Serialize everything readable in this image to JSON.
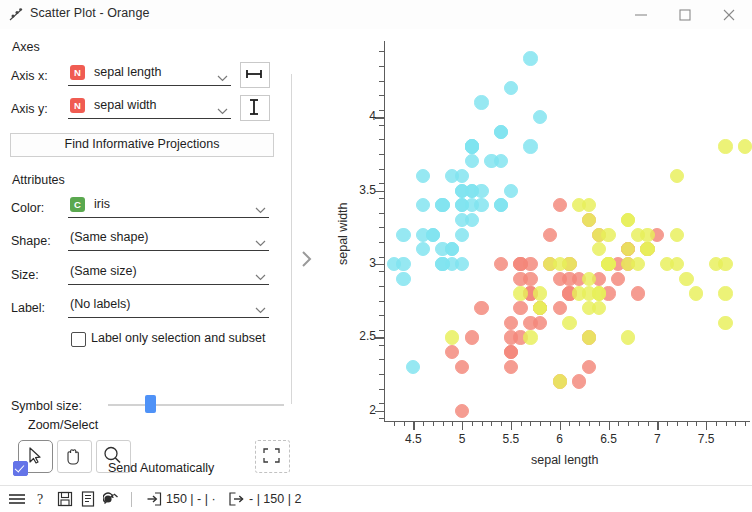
{
  "window": {
    "title": "Scatter Plot - Orange",
    "icon": "scatter-plot-icon",
    "minimize_label": "—",
    "maximize_label": "□",
    "close_label": "✕"
  },
  "panel": {
    "axes": {
      "group_label": "Axes",
      "x_label": "Axis x:",
      "x_value": "sepal length",
      "x_var_type": "N",
      "x_button_icon": "horizontal-resize-icon",
      "y_label": "Axis y:",
      "y_value": "sepal width",
      "y_var_type": "N",
      "y_button_icon": "vertical-resize-icon",
      "find_projections_label": "Find Informative Projections"
    },
    "attributes": {
      "group_label": "Attributes",
      "color_label": "Color:",
      "color_value": "iris",
      "color_var_type": "C",
      "shape_label": "Shape:",
      "shape_value": "(Same shape)",
      "size_label": "Size:",
      "size_value": "(Same size)",
      "label_label": "Label:",
      "label_value": "(No labels)",
      "label_only_checkbox": "Label only selection and subset",
      "label_only_checked": false,
      "symbol_size_label": "Symbol size:",
      "symbol_size_percent": 21
    },
    "zoom_select": {
      "group_label": "Zoom/Select",
      "tools": [
        {
          "name": "select-tool",
          "icon": "cursor-arrow-icon",
          "selected": true
        },
        {
          "name": "pan-tool",
          "icon": "hand-icon",
          "selected": false
        },
        {
          "name": "zoom-tool",
          "icon": "magnifier-icon",
          "selected": false
        }
      ],
      "reset_icon": "reset-zoom-icon"
    },
    "send": {
      "checkbox_checked": true,
      "label": "Send Automatically"
    },
    "expander_icon": "chevron-right-icon"
  },
  "statusbar": {
    "icons": [
      "hamburger-menu-icon",
      "help-icon",
      "save-icon",
      "report-icon",
      "clear-icon"
    ],
    "input_icon": "input-arrow-icon",
    "input_text": "150 | - | ·",
    "output_icon": "output-arrow-icon",
    "output_text": "- | 150 | 2"
  },
  "chart_data": {
    "type": "scatter",
    "title": "",
    "xlabel": "sepal length",
    "ylabel": "sepal width",
    "xlim": [
      4.2,
      7.95
    ],
    "ylim": [
      1.93,
      4.52
    ],
    "xticks": [
      4.5,
      5,
      5.5,
      6,
      6.5,
      7,
      7.5
    ],
    "xtick_labels": [
      "4.5",
      "5",
      "5.5",
      "6",
      "6.5",
      "7",
      "7.5"
    ],
    "yticks": [
      2,
      2.5,
      3,
      3.5,
      4
    ],
    "ytick_labels": [
      "2",
      "2.5",
      "3",
      "3.5",
      "4"
    ],
    "grid": false,
    "legend": "hidden",
    "color_by": "iris",
    "series": [
      {
        "name": "Iris-setosa",
        "color": "#7fe4f0",
        "points": [
          [
            5.1,
            3.5
          ],
          [
            4.9,
            3.0
          ],
          [
            4.7,
            3.2
          ],
          [
            4.6,
            3.1
          ],
          [
            5.0,
            3.6
          ],
          [
            5.4,
            3.9
          ],
          [
            4.6,
            3.4
          ],
          [
            5.0,
            3.4
          ],
          [
            4.4,
            2.9
          ],
          [
            4.9,
            3.1
          ],
          [
            5.4,
            3.7
          ],
          [
            4.8,
            3.4
          ],
          [
            4.8,
            3.0
          ],
          [
            4.3,
            3.0
          ],
          [
            5.8,
            4.0
          ],
          [
            5.7,
            4.4
          ],
          [
            5.4,
            3.9
          ],
          [
            5.1,
            3.5
          ],
          [
            5.7,
            3.8
          ],
          [
            5.1,
            3.8
          ],
          [
            5.4,
            3.4
          ],
          [
            5.1,
            3.7
          ],
          [
            4.6,
            3.6
          ],
          [
            5.1,
            3.3
          ],
          [
            4.8,
            3.4
          ],
          [
            5.0,
            3.0
          ],
          [
            5.0,
            3.4
          ],
          [
            5.2,
            3.5
          ],
          [
            5.2,
            3.4
          ],
          [
            4.7,
            3.2
          ],
          [
            4.8,
            3.1
          ],
          [
            5.4,
            3.4
          ],
          [
            5.2,
            4.1
          ],
          [
            5.5,
            4.2
          ],
          [
            4.9,
            3.1
          ],
          [
            5.0,
            3.2
          ],
          [
            5.5,
            3.5
          ],
          [
            4.9,
            3.6
          ],
          [
            4.4,
            3.0
          ],
          [
            5.1,
            3.4
          ],
          [
            5.0,
            3.5
          ],
          [
            4.5,
            2.3
          ],
          [
            4.4,
            3.2
          ],
          [
            5.0,
            3.5
          ],
          [
            5.1,
            3.8
          ],
          [
            4.8,
            3.0
          ],
          [
            5.1,
            3.8
          ],
          [
            4.6,
            3.2
          ],
          [
            5.3,
            3.7
          ],
          [
            5.0,
            3.3
          ]
        ]
      },
      {
        "name": "Iris-versicolor",
        "color": "#f4877a",
        "points": [
          [
            7.0,
            3.2
          ],
          [
            6.4,
            3.2
          ],
          [
            6.9,
            3.1
          ],
          [
            5.5,
            2.3
          ],
          [
            6.5,
            2.8
          ],
          [
            5.7,
            2.8
          ],
          [
            6.3,
            3.3
          ],
          [
            4.9,
            2.4
          ],
          [
            6.6,
            2.9
          ],
          [
            5.2,
            2.7
          ],
          [
            5.0,
            2.0
          ],
          [
            5.9,
            3.0
          ],
          [
            6.0,
            2.2
          ],
          [
            6.1,
            2.9
          ],
          [
            5.6,
            2.9
          ],
          [
            6.7,
            3.1
          ],
          [
            5.6,
            3.0
          ],
          [
            5.8,
            2.7
          ],
          [
            6.2,
            2.2
          ],
          [
            5.6,
            2.5
          ],
          [
            5.9,
            3.2
          ],
          [
            6.1,
            2.8
          ],
          [
            6.3,
            2.5
          ],
          [
            6.1,
            2.8
          ],
          [
            6.4,
            2.9
          ],
          [
            6.6,
            3.0
          ],
          [
            6.8,
            2.8
          ],
          [
            6.7,
            3.0
          ],
          [
            6.0,
            2.9
          ],
          [
            5.7,
            2.6
          ],
          [
            5.5,
            2.4
          ],
          [
            5.5,
            2.4
          ],
          [
            5.8,
            2.7
          ],
          [
            6.0,
            2.7
          ],
          [
            5.4,
            3.0
          ],
          [
            6.0,
            3.4
          ],
          [
            6.7,
            3.1
          ],
          [
            6.3,
            2.3
          ],
          [
            5.6,
            3.0
          ],
          [
            5.5,
            2.5
          ],
          [
            5.5,
            2.6
          ],
          [
            6.1,
            3.0
          ],
          [
            5.8,
            2.6
          ],
          [
            5.0,
            2.3
          ],
          [
            5.6,
            2.7
          ],
          [
            5.7,
            3.0
          ],
          [
            5.7,
            2.9
          ],
          [
            6.2,
            2.9
          ],
          [
            5.1,
            2.5
          ],
          [
            5.7,
            2.8
          ]
        ]
      },
      {
        "name": "Iris-virginica",
        "color": "#e8f05a",
        "points": [
          [
            6.3,
            3.3
          ],
          [
            5.8,
            2.7
          ],
          [
            7.1,
            3.0
          ],
          [
            6.3,
            2.9
          ],
          [
            6.5,
            3.0
          ],
          [
            7.6,
            3.0
          ],
          [
            4.9,
            2.5
          ],
          [
            7.3,
            2.9
          ],
          [
            6.7,
            2.5
          ],
          [
            7.2,
            3.6
          ],
          [
            6.5,
            3.2
          ],
          [
            6.4,
            2.7
          ],
          [
            6.8,
            3.0
          ],
          [
            5.7,
            2.5
          ],
          [
            5.8,
            2.8
          ],
          [
            6.4,
            3.2
          ],
          [
            6.5,
            3.0
          ],
          [
            7.7,
            3.8
          ],
          [
            7.7,
            2.6
          ],
          [
            6.0,
            2.2
          ],
          [
            6.9,
            3.2
          ],
          [
            5.6,
            2.8
          ],
          [
            7.7,
            2.8
          ],
          [
            6.3,
            2.7
          ],
          [
            6.7,
            3.3
          ],
          [
            7.2,
            3.2
          ],
          [
            6.2,
            2.8
          ],
          [
            6.1,
            3.0
          ],
          [
            6.4,
            2.8
          ],
          [
            7.2,
            3.0
          ],
          [
            7.4,
            2.8
          ],
          [
            7.9,
            3.8
          ],
          [
            6.4,
            2.8
          ],
          [
            6.3,
            2.8
          ],
          [
            6.1,
            2.6
          ],
          [
            7.7,
            3.0
          ],
          [
            6.3,
            3.4
          ],
          [
            6.4,
            3.1
          ],
          [
            6.0,
            3.0
          ],
          [
            6.9,
            3.1
          ],
          [
            6.7,
            3.1
          ],
          [
            6.9,
            3.1
          ],
          [
            5.8,
            2.7
          ],
          [
            6.8,
            3.2
          ],
          [
            6.7,
            3.3
          ],
          [
            6.7,
            3.0
          ],
          [
            6.3,
            2.5
          ],
          [
            6.5,
            3.0
          ],
          [
            6.2,
            3.4
          ],
          [
            5.9,
            3.0
          ]
        ]
      }
    ]
  }
}
